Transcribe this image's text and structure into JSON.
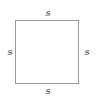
{
  "diagram": {
    "shape": "square",
    "labels": {
      "top": "s",
      "bottom": "s",
      "left": "s",
      "right": "s"
    },
    "colors": {
      "stroke": "#9a9a9a",
      "label": "#333333"
    }
  }
}
